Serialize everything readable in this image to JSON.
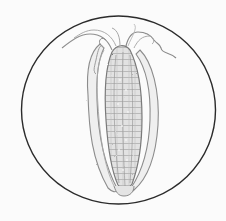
{
  "illustration": {
    "subject": "ear of corn sketch",
    "style": "pencil drawing",
    "frame": "circle",
    "colors": {
      "background": "#fbfbfb",
      "circle_stroke": "#2b2b2b",
      "sketch_dark": "#6e6e6e",
      "sketch_mid": "#9a9a9a",
      "sketch_light": "#c4c4c4",
      "fill": "#e9e9e9"
    }
  }
}
